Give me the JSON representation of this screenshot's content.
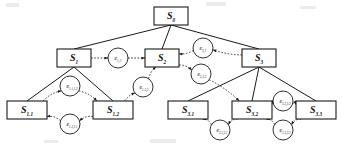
{
  "diagram": {
    "type": "tree-with-transitions",
    "colors": {
      "node_stroke": "#1a1a1a",
      "node_fill": "#ffffff",
      "solid_edge": "#1a1a1a",
      "dotted_edge": "#1a1a1a",
      "text": "#111111"
    },
    "nodes": [
      {
        "id": "S0",
        "base": "S",
        "sub": "0",
        "cx": 171,
        "cy": 16,
        "w": 34,
        "h": 18
      },
      {
        "id": "S1",
        "base": "S",
        "sub": "1",
        "cx": 74,
        "cy": 58,
        "w": 34,
        "h": 18
      },
      {
        "id": "S2",
        "base": "S",
        "sub": "2",
        "cx": 162,
        "cy": 58,
        "w": 34,
        "h": 18
      },
      {
        "id": "S3",
        "base": "S",
        "sub": "3",
        "cx": 259,
        "cy": 58,
        "w": 34,
        "h": 18
      },
      {
        "id": "S1.1",
        "base": "S",
        "sub": "1.1",
        "cx": 27,
        "cy": 110,
        "w": 40,
        "h": 18
      },
      {
        "id": "S1.2",
        "base": "S",
        "sub": "1.2",
        "cx": 113,
        "cy": 110,
        "w": 40,
        "h": 18
      },
      {
        "id": "S3.1",
        "base": "S",
        "sub": "3.1",
        "cx": 188,
        "cy": 110,
        "w": 40,
        "h": 18
      },
      {
        "id": "S3.2",
        "base": "S",
        "sub": "3.2",
        "cx": 252,
        "cy": 110,
        "w": 40,
        "h": 18
      },
      {
        "id": "S3.3",
        "base": "S",
        "sub": "3.3",
        "cx": 316,
        "cy": 110,
        "w": 40,
        "h": 18
      }
    ],
    "edge_nodes": [
      {
        "id": "e1,2",
        "base": "e",
        "sub": "1,2",
        "cx": 118,
        "cy": 58,
        "r": 10
      },
      {
        "id": "e3,2",
        "base": "e",
        "sub": "3,2",
        "cx": 203,
        "cy": 48,
        "r": 10
      },
      {
        "id": "e2,3.2",
        "base": "e",
        "sub": "2,3.2",
        "cx": 201,
        "cy": 74,
        "r": 10
      },
      {
        "id": "e1.1,1.2",
        "base": "e",
        "sub": "1.1,1.2",
        "cx": 70,
        "cy": 86,
        "r": 10
      },
      {
        "id": "e1.2,1.1",
        "base": "e",
        "sub": "1.2,1.1",
        "cx": 70,
        "cy": 124,
        "r": 10
      },
      {
        "id": "e1.2,2",
        "base": "e",
        "sub": "1.2,2",
        "cx": 143,
        "cy": 87,
        "r": 10
      },
      {
        "id": "e3.2,3.3",
        "base": "e",
        "sub": "3.2,3.3",
        "cx": 283,
        "cy": 101,
        "r": 10
      },
      {
        "id": "e3.2,3.1",
        "base": "e",
        "sub": "3.2,3.1",
        "cx": 220,
        "cy": 130,
        "r": 10
      },
      {
        "id": "e3.3,3.2",
        "base": "e",
        "sub": "3.3,3.2",
        "cx": 283,
        "cy": 130,
        "r": 10
      }
    ],
    "tree_edges": [
      {
        "from": "S0",
        "to": "S1",
        "style": "solid"
      },
      {
        "from": "S0",
        "to": "S2",
        "style": "solid"
      },
      {
        "from": "S0",
        "to": "S3",
        "style": "solid"
      },
      {
        "from": "S1",
        "to": "S1.1",
        "style": "solid"
      },
      {
        "from": "S1",
        "to": "S1.2",
        "style": "solid"
      },
      {
        "from": "S3",
        "to": "S3.1",
        "style": "solid"
      },
      {
        "from": "S3",
        "to": "S3.2",
        "style": "solid"
      },
      {
        "from": "S3",
        "to": "S3.3",
        "style": "solid"
      }
    ],
    "transition_edges": [
      {
        "from": "S1",
        "via": "e1,2",
        "to": "S2",
        "style": "dotted"
      },
      {
        "from": "S3",
        "via": "e3,2",
        "to": "S2",
        "style": "dotted"
      },
      {
        "from": "S2",
        "via": "e2,3.2",
        "to": "S3.2",
        "style": "dotted"
      },
      {
        "from": "S1.1",
        "via": "e1.1,1.2",
        "to": "S1.2",
        "style": "dotted"
      },
      {
        "from": "S1.2",
        "via": "e1.2,1.1",
        "to": "S1.1",
        "style": "dotted"
      },
      {
        "from": "S1.2",
        "via": "e1.2,2",
        "to": "S2",
        "style": "dotted"
      },
      {
        "from": "S3.2",
        "via": "e3.2,3.3",
        "to": "S3.3",
        "style": "dotted"
      },
      {
        "from": "S3.2",
        "via": "e3.2,3.1",
        "to": "S3.1",
        "style": "dotted"
      },
      {
        "from": "S3.3",
        "via": "e3.3,3.2",
        "to": "S3.2",
        "style": "dotted"
      }
    ]
  }
}
